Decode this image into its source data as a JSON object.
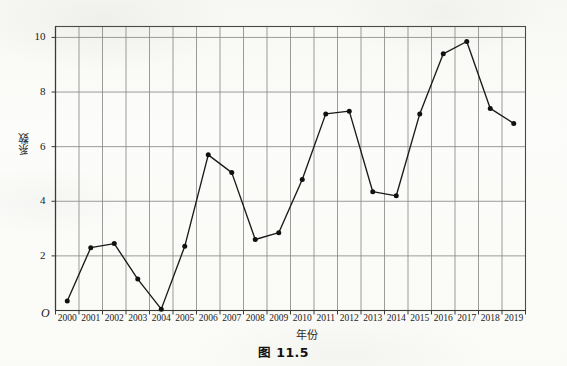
{
  "chart_data": {
    "type": "line",
    "title": "",
    "caption": "图 11.5",
    "xlabel": "年份",
    "ylabel": "系数",
    "grid": true,
    "legend": "none",
    "origin_label": "O",
    "xlim": [
      1999.5,
      2019.5
    ],
    "ylim": [
      0,
      10.4
    ],
    "y_ticks": [
      2,
      4,
      6,
      8,
      10
    ],
    "y_tick_labels": [
      "2",
      "4",
      "6",
      "8",
      "10"
    ],
    "categories": [
      "2000",
      "2001",
      "2002",
      "2003",
      "2004",
      "2005",
      "2006",
      "2007",
      "2008",
      "2009",
      "2010",
      "2011",
      "2012",
      "2013",
      "2014",
      "2015",
      "2016",
      "2017",
      "2018",
      "2019"
    ],
    "x": [
      2000,
      2001,
      2002,
      2003,
      2004,
      2005,
      2006,
      2007,
      2008,
      2009,
      2010,
      2011,
      2012,
      2013,
      2014,
      2015,
      2016,
      2017,
      2018,
      2019
    ],
    "values": [
      0.35,
      2.3,
      2.45,
      1.15,
      0.05,
      2.35,
      5.7,
      5.05,
      2.6,
      2.85,
      4.8,
      7.2,
      7.3,
      4.35,
      4.2,
      7.2,
      9.4,
      9.85,
      7.4,
      6.85
    ],
    "series": [
      {
        "name": "系数",
        "marker": "filled-circle",
        "line_color": "#1a1a1a",
        "marker_color": "#111111",
        "values": [
          0.35,
          2.3,
          2.45,
          1.15,
          0.05,
          2.35,
          5.7,
          5.05,
          2.6,
          2.85,
          4.8,
          7.2,
          7.3,
          4.35,
          4.2,
          7.2,
          9.4,
          9.85,
          7.4,
          6.85
        ]
      }
    ],
    "colors": {
      "line": "#1a1a1a",
      "marker": "#111111",
      "grid": "#8a8a8a",
      "axis": "#4a4a4a",
      "background": "#fbfbf9",
      "text": "#1a1a1a"
    }
  }
}
